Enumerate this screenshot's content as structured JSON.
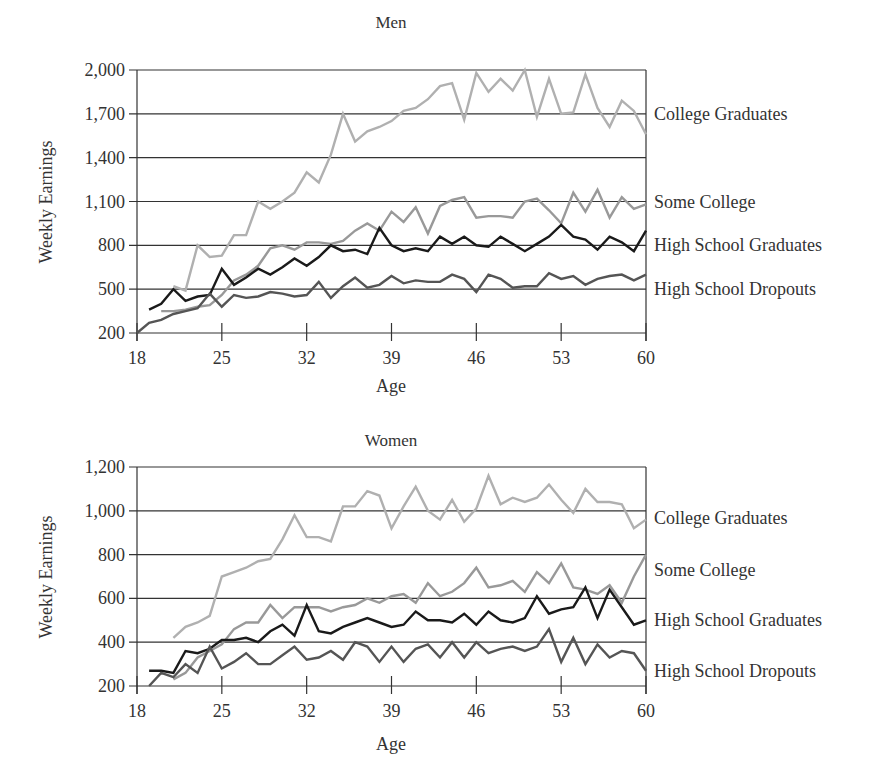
{
  "chart_data": [
    {
      "type": "line",
      "title": "Men",
      "xlabel": "Age",
      "ylabel": "Weekly Earnings",
      "xlim": [
        18,
        60
      ],
      "ylim": [
        200,
        2000
      ],
      "x_ticks": [
        18,
        25,
        32,
        39,
        46,
        53,
        60
      ],
      "y_ticks": [
        200,
        500,
        800,
        1100,
        1400,
        1700,
        2000
      ],
      "y_tick_labels": [
        "200",
        "500",
        "800",
        "1,100",
        "1,400",
        "1,700",
        "2,000"
      ],
      "grid": "horizontal",
      "legend_position": "right-inline",
      "x": [
        18,
        19,
        20,
        21,
        22,
        23,
        24,
        25,
        26,
        27,
        28,
        29,
        30,
        31,
        32,
        33,
        34,
        35,
        36,
        37,
        38,
        39,
        40,
        41,
        42,
        43,
        44,
        45,
        46,
        47,
        48,
        49,
        50,
        51,
        52,
        53,
        54,
        55,
        56,
        57,
        58,
        59,
        60
      ],
      "series": [
        {
          "name": "College Graduates",
          "color": "#b0b0b0",
          "label_y": 1700,
          "values": [
            null,
            null,
            null,
            520,
            490,
            800,
            720,
            730,
            870,
            870,
            1100,
            1050,
            1100,
            1160,
            1300,
            1230,
            1420,
            1700,
            1510,
            1580,
            1610,
            1650,
            1720,
            1740,
            1800,
            1890,
            1910,
            1660,
            1980,
            1850,
            1940,
            1860,
            2000,
            1680,
            1940,
            1700,
            1710,
            1970,
            1740,
            1610,
            1790,
            1720,
            1560
          ]
        },
        {
          "name": "Some College",
          "color": "#999999",
          "label_y": 1100,
          "values": [
            null,
            null,
            350,
            350,
            360,
            380,
            390,
            460,
            560,
            600,
            660,
            780,
            800,
            770,
            820,
            820,
            810,
            830,
            900,
            950,
            900,
            1030,
            960,
            1060,
            880,
            1070,
            1110,
            1130,
            990,
            1000,
            1000,
            990,
            1100,
            1120,
            1040,
            950,
            1160,
            1030,
            1180,
            990,
            1130,
            1050,
            1080,
            1530
          ]
        },
        {
          "name": "High School Graduates",
          "color": "#1a1a1a",
          "label_y": 800,
          "values": [
            null,
            360,
            400,
            500,
            420,
            450,
            460,
            640,
            530,
            580,
            640,
            600,
            650,
            710,
            660,
            720,
            800,
            760,
            770,
            740,
            920,
            800,
            760,
            780,
            760,
            860,
            810,
            860,
            800,
            790,
            860,
            810,
            760,
            810,
            860,
            940,
            860,
            840,
            770,
            860,
            820,
            760,
            900
          ]
        },
        {
          "name": "High School Dropouts",
          "color": "#555555",
          "label_y": 500,
          "values": [
            200,
            270,
            290,
            330,
            350,
            370,
            470,
            380,
            460,
            440,
            450,
            480,
            470,
            450,
            460,
            550,
            440,
            520,
            580,
            510,
            530,
            590,
            540,
            560,
            550,
            550,
            600,
            570,
            480,
            600,
            570,
            510,
            520,
            520,
            610,
            570,
            590,
            530,
            570,
            590,
            600,
            560,
            600,
            540
          ]
        }
      ]
    },
    {
      "type": "line",
      "title": "Women",
      "xlabel": "Age",
      "ylabel": "Weekly Earnings",
      "xlim": [
        18,
        60
      ],
      "ylim": [
        200,
        1200
      ],
      "x_ticks": [
        18,
        25,
        32,
        39,
        46,
        53,
        60
      ],
      "y_ticks": [
        200,
        400,
        600,
        800,
        1000,
        1200
      ],
      "y_tick_labels": [
        "200",
        "400",
        "600",
        "800",
        "1,000",
        "1,200"
      ],
      "grid": "horizontal",
      "legend_position": "right-inline",
      "x": [
        18,
        19,
        20,
        21,
        22,
        23,
        24,
        25,
        26,
        27,
        28,
        29,
        30,
        31,
        32,
        33,
        34,
        35,
        36,
        37,
        38,
        39,
        40,
        41,
        42,
        43,
        44,
        45,
        46,
        47,
        48,
        49,
        50,
        51,
        52,
        53,
        54,
        55,
        56,
        57,
        58,
        59,
        60
      ],
      "series": [
        {
          "name": "College Graduates",
          "color": "#b0b0b0",
          "label_y": 965,
          "values": [
            null,
            null,
            null,
            420,
            470,
            490,
            520,
            700,
            720,
            740,
            770,
            780,
            870,
            980,
            880,
            880,
            860,
            1020,
            1020,
            1090,
            1070,
            920,
            1020,
            1110,
            1000,
            960,
            1050,
            950,
            1010,
            1160,
            1030,
            1060,
            1040,
            1060,
            1120,
            1050,
            990,
            1100,
            1040,
            1040,
            1030,
            920,
            960
          ]
        },
        {
          "name": "Some College",
          "color": "#999999",
          "label_y": 730,
          "values": [
            null,
            null,
            null,
            230,
            260,
            330,
            360,
            390,
            460,
            490,
            490,
            570,
            510,
            560,
            560,
            560,
            540,
            560,
            570,
            600,
            580,
            610,
            620,
            580,
            670,
            610,
            630,
            670,
            740,
            650,
            660,
            680,
            630,
            720,
            670,
            760,
            650,
            640,
            620,
            660,
            580,
            700,
            800,
            720,
            660,
            610,
            540,
            760
          ]
        },
        {
          "name": "High School Graduates",
          "color": "#1a1a1a",
          "label_y": 500,
          "values": [
            null,
            270,
            270,
            260,
            360,
            350,
            370,
            410,
            410,
            420,
            400,
            450,
            480,
            430,
            570,
            450,
            440,
            470,
            490,
            510,
            490,
            470,
            480,
            540,
            500,
            500,
            490,
            530,
            480,
            540,
            500,
            490,
            510,
            610,
            530,
            550,
            560,
            650,
            510,
            640,
            560,
            480,
            500
          ]
        },
        {
          "name": "High School Dropouts",
          "color": "#555555",
          "label_y": 270,
          "values": [
            null,
            200,
            260,
            240,
            300,
            260,
            380,
            280,
            310,
            350,
            300,
            300,
            340,
            380,
            320,
            330,
            360,
            320,
            400,
            380,
            310,
            380,
            310,
            370,
            390,
            330,
            400,
            330,
            400,
            350,
            370,
            380,
            360,
            380,
            460,
            310,
            420,
            300,
            390,
            330,
            360,
            350,
            270
          ]
        }
      ]
    }
  ],
  "men": {
    "title": "Men",
    "ylabel": "Weekly Earnings",
    "xlabel": "Age"
  },
  "women": {
    "title": "Women",
    "ylabel": "Weekly Earnings",
    "xlabel": "Age"
  }
}
